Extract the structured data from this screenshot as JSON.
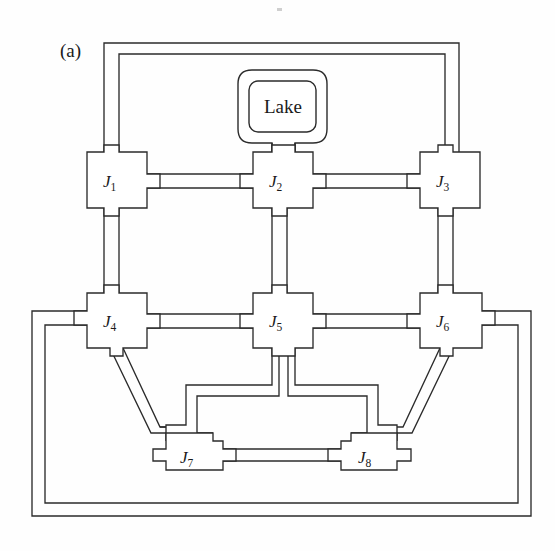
{
  "figure": {
    "panel_label": "(a)",
    "caption_visible": false,
    "type": "schematic-network-diagram",
    "background_color": "#fefefe",
    "line_color": "#2b2b2b"
  },
  "lake": {
    "label": "Lake",
    "shape": "rounded-rectangle-double-outline",
    "connected_to": "J2"
  },
  "nodes": [
    {
      "id": "J1",
      "base": "J",
      "subscript": "1",
      "label": "J1",
      "x": 117,
      "y": 180
    },
    {
      "id": "J2",
      "base": "J",
      "subscript": "2",
      "label": "J2",
      "x": 283,
      "y": 180
    },
    {
      "id": "J3",
      "base": "J",
      "subscript": "3",
      "label": "J3",
      "x": 450,
      "y": 180
    },
    {
      "id": "J4",
      "base": "J",
      "subscript": "4",
      "label": "J4",
      "x": 117,
      "y": 320
    },
    {
      "id": "J5",
      "base": "J",
      "subscript": "5",
      "label": "J5",
      "x": 283,
      "y": 320
    },
    {
      "id": "J6",
      "base": "J",
      "subscript": "6",
      "label": "J6",
      "x": 450,
      "y": 320
    },
    {
      "id": "J7",
      "base": "J",
      "subscript": "7",
      "label": "J7",
      "x": 193,
      "y": 455
    },
    {
      "id": "J8",
      "base": "J",
      "subscript": "8",
      "label": "J8",
      "x": 371,
      "y": 455
    }
  ],
  "edges": [
    {
      "from": "Lake",
      "to": "J2",
      "style": "double-line-channel",
      "orientation": "vertical"
    },
    {
      "from": "J1",
      "to": "J2",
      "style": "double-line-channel",
      "orientation": "horizontal"
    },
    {
      "from": "J2",
      "to": "J3",
      "style": "double-line-channel",
      "orientation": "horizontal"
    },
    {
      "from": "J1",
      "to": "J3",
      "style": "double-line-channel",
      "orientation": "outer-top-loop"
    },
    {
      "from": "J1",
      "to": "J4",
      "style": "double-line-channel",
      "orientation": "vertical"
    },
    {
      "from": "J2",
      "to": "J5",
      "style": "double-line-channel",
      "orientation": "vertical"
    },
    {
      "from": "J3",
      "to": "J6",
      "style": "double-line-channel",
      "orientation": "vertical"
    },
    {
      "from": "J4",
      "to": "J5",
      "style": "double-line-channel",
      "orientation": "horizontal"
    },
    {
      "from": "J5",
      "to": "J6",
      "style": "double-line-channel",
      "orientation": "horizontal"
    },
    {
      "from": "J4",
      "to": "J6",
      "style": "double-line-channel",
      "orientation": "outer-bottom-loop"
    },
    {
      "from": "J4",
      "to": "J7",
      "style": "double-line-channel",
      "orientation": "diagonal"
    },
    {
      "from": "J6",
      "to": "J8",
      "style": "double-line-channel",
      "orientation": "diagonal"
    },
    {
      "from": "J5",
      "to": "J7",
      "style": "double-line-channel",
      "orientation": "vertical-then-horizontal"
    },
    {
      "from": "J5",
      "to": "J8",
      "style": "double-line-channel",
      "orientation": "vertical-then-horizontal"
    },
    {
      "from": "J7",
      "to": "J8",
      "style": "double-line-channel",
      "orientation": "horizontal"
    }
  ],
  "counts": {
    "junctions": 8,
    "reservoirs": 1,
    "links": 15
  }
}
